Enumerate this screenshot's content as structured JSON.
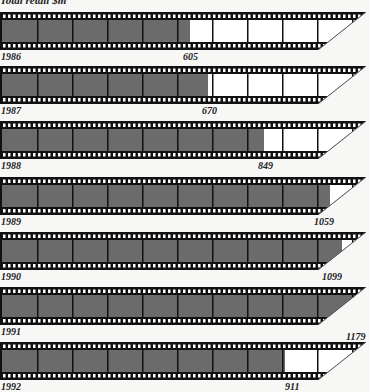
{
  "title": "Total retail $m",
  "colors": {
    "filled": "#6b6b6b",
    "empty": "#ffffff",
    "border": "#111111",
    "background": "#f7f7f5"
  },
  "chart_data": {
    "type": "bar",
    "subtype": "pictograph-filmstrip",
    "title": "Total retail $m",
    "xlabel": "",
    "ylabel": "Total retail $m",
    "categories": [
      "1986",
      "1987",
      "1988",
      "1989",
      "1990",
      "1991",
      "1992"
    ],
    "values": [
      605,
      670,
      849,
      1059,
      1099,
      1179,
      911
    ],
    "ylim": [
      0,
      1179
    ],
    "grid": false,
    "legend": "none"
  },
  "strips": [
    {
      "year": "1986",
      "value": "605",
      "top": 12,
      "fill": 190,
      "labelX": 183
    },
    {
      "year": "1987",
      "value": "670",
      "top": 66,
      "fill": 208,
      "labelX": 202
    },
    {
      "year": "1988",
      "value": "849",
      "top": 121,
      "fill": 264,
      "labelX": 258
    },
    {
      "year": "1989",
      "value": "1059",
      "top": 177,
      "fill": 330,
      "labelX": 314
    },
    {
      "year": "1990",
      "value": "1099",
      "top": 232,
      "fill": 342,
      "labelX": 322
    },
    {
      "year": "1991",
      "value": "1179",
      "top": 287,
      "fill": 370,
      "labelX": 346
    },
    {
      "year": "1992",
      "value": "911",
      "top": 342,
      "fill": 285,
      "labelX": 285
    }
  ]
}
